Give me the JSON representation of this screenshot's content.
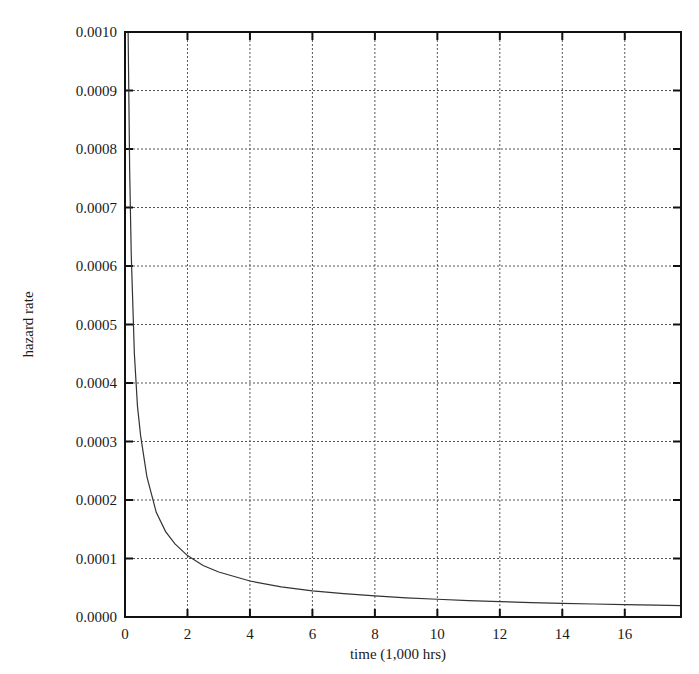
{
  "chart_data": {
    "type": "line",
    "title": "",
    "xlabel": "time (1,000 hrs)",
    "ylabel": "hazard rate",
    "xlim": [
      0,
      17.8
    ],
    "ylim": [
      0,
      0.001
    ],
    "grid": true,
    "legend": "none",
    "x_ticks": [
      0,
      2,
      4,
      6,
      8,
      10,
      12,
      14,
      16
    ],
    "x_tick_labels": [
      "0",
      "2",
      "4",
      "6",
      "8",
      "10",
      "12",
      "14",
      "16"
    ],
    "y_ticks": [
      0,
      0.0001,
      0.0002,
      0.0003,
      0.0004,
      0.0005,
      0.0006,
      0.0007,
      0.0008,
      0.0009,
      0.001
    ],
    "y_tick_labels": [
      "0.0000",
      "0.0001",
      "0.0002",
      "0.0003",
      "0.0004",
      "0.0005",
      "0.0006",
      "0.0007",
      "0.0008",
      "0.0009",
      "0.0010"
    ],
    "series": [
      {
        "name": "hazard rate",
        "color": "#333333",
        "x": [
          0.1,
          0.15,
          0.2,
          0.3,
          0.4,
          0.5,
          0.7,
          1.0,
          1.3,
          1.6,
          2.0,
          2.5,
          3.0,
          4.0,
          5.0,
          6.0,
          7.0,
          8.0,
          9.0,
          10.0,
          11.0,
          12.0,
          13.0,
          14.0,
          15.0,
          16.0,
          17.0,
          17.8
        ],
        "y": [
          0.00105,
          0.00076,
          0.00062,
          0.00045,
          0.00036,
          0.00031,
          0.00024,
          0.000179,
          0.000146,
          0.000125,
          0.000105,
          8.8e-05,
          7.7e-05,
          6.15e-05,
          5.15e-05,
          4.48e-05,
          3.99e-05,
          3.6e-05,
          3.28e-05,
          3.03e-05,
          2.81e-05,
          2.63e-05,
          2.47e-05,
          2.34e-05,
          2.22e-05,
          2.11e-05,
          2.02e-05,
          1.95e-05
        ]
      }
    ]
  }
}
